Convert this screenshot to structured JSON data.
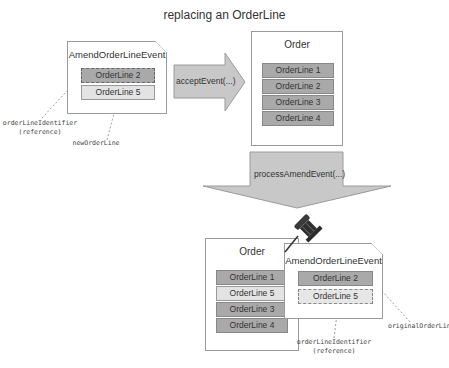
{
  "title": "replacing an OrderLine",
  "top_left_event": {
    "label": "AmendOrderLineEvent",
    "lines": [
      "OrderLine 2",
      "OrderLine 5"
    ],
    "annotations": {
      "identifier": "orderLineIdentifier",
      "identifier_sub": "(reference)",
      "new_line": "newOrderLine"
    }
  },
  "accept_arrow": {
    "label": "acceptEvent(...)"
  },
  "top_order": {
    "label": "Order",
    "lines": [
      "OrderLine 1",
      "OrderLine 2",
      "OrderLine 3",
      "OrderLine 4"
    ]
  },
  "process_arrow": {
    "label": "processAmendEvent(...)"
  },
  "bottom_order": {
    "label": "Order",
    "lines": [
      "OrderLine 1",
      "OrderLine 5",
      "OrderLine 3",
      "OrderLine 4"
    ]
  },
  "bottom_event": {
    "label": "AmendOrderLineEvent",
    "lines": [
      "OrderLine 2",
      "OrderLine 5"
    ],
    "annotations": {
      "original_line": "originalOrderLine",
      "identifier": "orderLineIdentifier",
      "identifier_sub": "(reference)"
    }
  },
  "icons": {
    "pin": "pushpin-icon"
  },
  "colors": {
    "dark_line": "#a9a9a9",
    "light_line": "#e3e3e3",
    "arrow_fill": "#c8c8c8",
    "border": "#9a9a9a"
  }
}
